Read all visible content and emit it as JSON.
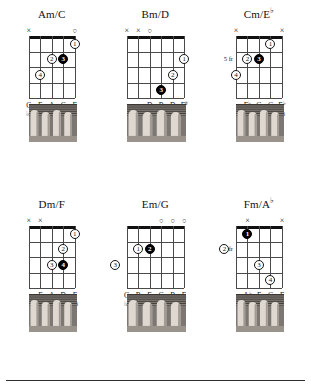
{
  "page": {
    "bottom_rule": true
  },
  "chords": [
    {
      "id": "am-c",
      "title": "Am/C",
      "title_sup": "",
      "strings": 5,
      "frets": 4,
      "position_label": "",
      "nut_thick": true,
      "markers": [
        {
          "string": 1,
          "symbol": "×"
        },
        {
          "string": 5,
          "symbol": "○"
        }
      ],
      "dots": [
        {
          "string": 5,
          "fret": 1,
          "finger": "1",
          "filled": false
        },
        {
          "string": 3,
          "fret": 2,
          "finger": "2",
          "filled": false
        },
        {
          "string": 4,
          "fret": 2,
          "finger": "3",
          "filled": true
        },
        {
          "string": 2,
          "fret": 3,
          "finger": "4",
          "filled": false
        }
      ],
      "notes": [
        "C",
        "E",
        "A",
        "C",
        "E"
      ],
      "note_sups": [
        "",
        "",
        "",
        "",
        ""
      ],
      "intervals": [
        "♭3",
        "5",
        "1",
        "♭3",
        "5"
      ]
    },
    {
      "id": "bm-d",
      "title": "Bm/D",
      "title_sup": "",
      "strings": 6,
      "frets": 4,
      "position_label": "",
      "nut_thick": true,
      "markers": [
        {
          "string": 1,
          "symbol": "×"
        },
        {
          "string": 2,
          "symbol": "×"
        },
        {
          "string": 3,
          "symbol": "○"
        }
      ],
      "dots": [
        {
          "string": 6,
          "fret": 2,
          "finger": "1",
          "filled": false
        },
        {
          "string": 5,
          "fret": 3,
          "finger": "2",
          "filled": false
        },
        {
          "string": 4,
          "fret": 4,
          "finger": "3",
          "filled": true
        }
      ],
      "notes": [
        "D",
        "B",
        "D",
        "F"
      ],
      "note_sups": [
        "",
        "",
        "",
        "♯"
      ],
      "intervals": [
        "♭3",
        "1",
        "♭3",
        "5"
      ]
    },
    {
      "id": "cm-eb",
      "title": "Cm/E",
      "title_sup": "♭",
      "strings": 5,
      "frets": 4,
      "position_label": "5 fr",
      "nut_thick": true,
      "markers": [
        {
          "string": 1,
          "symbol": "×"
        },
        {
          "string": 5,
          "symbol": "×"
        }
      ],
      "dots": [
        {
          "string": 4,
          "fret": 1,
          "finger": "1",
          "filled": false
        },
        {
          "string": 2,
          "fret": 2,
          "finger": "2",
          "filled": false
        },
        {
          "string": 3,
          "fret": 2,
          "finger": "3",
          "filled": true
        },
        {
          "string": 1,
          "fret": 3,
          "finger": "4",
          "filled": false
        }
      ],
      "notes": [
        "E",
        "G",
        "C",
        "E"
      ],
      "note_sups": [
        "♭",
        "",
        "",
        "♭"
      ],
      "intervals": [
        "♭3",
        "5",
        "1",
        "♭3"
      ]
    },
    {
      "id": "dm-f",
      "title": "Dm/F",
      "title_sup": "",
      "strings": 5,
      "frets": 4,
      "position_label": "",
      "nut_thick": true,
      "markers": [
        {
          "string": 1,
          "symbol": "×"
        },
        {
          "string": 2,
          "symbol": "×"
        }
      ],
      "dots": [
        {
          "string": 5,
          "fret": 1,
          "finger": "1",
          "filled": false
        },
        {
          "string": 4,
          "fret": 2,
          "finger": "2",
          "filled": false
        },
        {
          "string": 3,
          "fret": 3,
          "finger": "3",
          "filled": false
        },
        {
          "string": 4,
          "fret": 3,
          "finger": "4",
          "filled": true
        }
      ],
      "notes": [
        "F",
        "A",
        "D",
        "F"
      ],
      "note_sups": [
        "",
        "",
        "",
        ""
      ],
      "intervals": [
        "♭3",
        "5",
        "1",
        "♭3"
      ]
    },
    {
      "id": "em-g",
      "title": "Em/G",
      "title_sup": "",
      "strings": 6,
      "frets": 4,
      "position_label": "",
      "nut_thick": true,
      "markers": [
        {
          "string": 4,
          "symbol": "○"
        },
        {
          "string": 5,
          "symbol": "○"
        },
        {
          "string": 6,
          "symbol": "○"
        }
      ],
      "dots": [
        {
          "string": 2,
          "fret": 2,
          "finger": "1",
          "filled": false
        },
        {
          "string": 3,
          "fret": 2,
          "finger": "2",
          "filled": true
        },
        {
          "string": 0,
          "fret": 3,
          "finger": "3",
          "filled": false
        }
      ],
      "notes": [
        "G",
        "B",
        "E",
        "G",
        "B",
        "E"
      ],
      "note_sups": [
        "",
        "",
        "",
        "",
        "",
        ""
      ],
      "intervals": [
        "♭3",
        "5",
        "1",
        "♭3",
        "5",
        "1"
      ]
    },
    {
      "id": "fm-ab",
      "title": "Fm/A",
      "title_sup": "♭",
      "strings": 5,
      "frets": 4,
      "position_label": "3 fr",
      "nut_thick": true,
      "markers": [
        {
          "string": 2,
          "symbol": "×"
        },
        {
          "string": 5,
          "symbol": "×"
        }
      ],
      "dots": [
        {
          "string": 2,
          "fret": 1,
          "finger": "1",
          "filled": true
        },
        {
          "string": 0,
          "fret": 2,
          "finger": "2",
          "filled": false
        },
        {
          "string": 3,
          "fret": 3,
          "finger": "3",
          "filled": false
        },
        {
          "string": 4,
          "fret": 4,
          "finger": "4",
          "filled": false
        }
      ],
      "notes": [
        "A",
        "F",
        "C",
        "F"
      ],
      "note_sups": [
        "♭",
        "",
        "",
        ""
      ],
      "intervals": [
        "♭3",
        "1",
        "5",
        "1"
      ]
    }
  ]
}
